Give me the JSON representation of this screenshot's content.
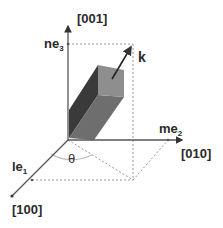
{
  "diagram": {
    "axes": {
      "z": {
        "label": "[001]",
        "tick_label": "ne",
        "tick_sub": "3"
      },
      "y": {
        "label": "[010]",
        "tick_label": "me",
        "tick_sub": "2"
      },
      "x": {
        "label": "[100]",
        "tick_label": "le",
        "tick_sub": "1"
      }
    },
    "vector_label": "k",
    "angle_label": "θ",
    "colors": {
      "axis": "#555555",
      "dotted": "#9a9a9a",
      "face_dark": "#3a3a3a",
      "face_mid": "#6e6e6e",
      "face_light": "#8e8e8e"
    }
  }
}
